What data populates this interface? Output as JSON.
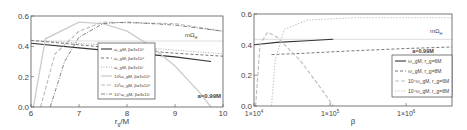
{
  "chart_data": [
    {
      "type": "line",
      "title": "",
      "xlabel": "r_g/M",
      "ylabel": "",
      "xlim": [
        6,
        10
      ],
      "ylim": [
        0.0,
        0.6
      ],
      "xticks": [
        "6",
        "7",
        "8",
        "9",
        "10"
      ],
      "yticks": [
        "0.0",
        "0.2",
        "0.4",
        "0.6"
      ],
      "grid": false,
      "legend_position": "center",
      "annotations": [
        "mΩ_H",
        "a=0.99M"
      ],
      "series": [
        {
          "name": "ω_gM, β=3x10^5",
          "style": "solid",
          "x": [
            6,
            7,
            8,
            9,
            9.75
          ],
          "y": [
            0.42,
            0.39,
            0.36,
            0.33,
            0.3
          ]
        },
        {
          "name": "ω_gM, β=3x10^6",
          "style": "dashed",
          "x": [
            6,
            7,
            8,
            9,
            10
          ],
          "y": [
            0.44,
            0.41,
            0.38,
            0.355,
            0.335
          ]
        },
        {
          "name": "ω_gM, β=3x10^7",
          "style": "dotted",
          "x": [
            6,
            7,
            8,
            9,
            10
          ],
          "y": [
            0.44,
            0.42,
            0.4,
            0.375,
            0.35
          ]
        },
        {
          "name": "10^2ω_gM, β=3x10^5",
          "style": "light-solid",
          "x": [
            6.05,
            6.3,
            7,
            7.5,
            8,
            8.5,
            9,
            9.5,
            9.75
          ],
          "y": [
            0.0,
            0.45,
            0.56,
            0.55,
            0.5,
            0.4,
            0.27,
            0.1,
            0.0
          ]
        },
        {
          "name": "10^3ω_gM, β=3x10^6",
          "style": "light-dashed",
          "x": [
            6.2,
            6.5,
            7,
            7.5,
            8,
            9,
            10
          ],
          "y": [
            0.0,
            0.35,
            0.5,
            0.56,
            0.555,
            0.55,
            0.5
          ]
        },
        {
          "name": "10^4ω_gM, β=3x10^7",
          "style": "dash-dot",
          "x": [
            6.4,
            6.7,
            7,
            7.5,
            8,
            9,
            10
          ],
          "y": [
            0.0,
            0.3,
            0.46,
            0.55,
            0.56,
            0.54,
            0.5
          ]
        }
      ],
      "reference_line": {
        "name": "mΩ_H",
        "y": 0.435
      }
    },
    {
      "type": "line",
      "title": "",
      "xlabel": "β",
      "ylabel": "",
      "xscale": "log",
      "xlim": [
        10000,
        4000000
      ],
      "ylim": [
        0.0,
        0.6
      ],
      "xticks": [
        "1×10^4",
        "1×10^5",
        "1×10^6"
      ],
      "yticks": [
        "0.0",
        "0.2",
        "0.4",
        "0.6"
      ],
      "grid": false,
      "legend_position": "lower right",
      "annotations": [
        "mΩ_H",
        "a=0.99M"
      ],
      "series": [
        {
          "name": "ω_gM, r_g=6M",
          "style": "solid",
          "x": [
            10000,
            20000,
            50000,
            110000
          ],
          "y": [
            0.4,
            0.415,
            0.425,
            0.435
          ]
        },
        {
          "name": "ω_gM, r_g=8M",
          "style": "dashed",
          "x": [
            17000,
            50000,
            200000,
            1000000,
            4000000
          ],
          "y": [
            0.335,
            0.345,
            0.36,
            0.375,
            0.385
          ]
        },
        {
          "name": "10^4ω_gM, r_g=6M",
          "style": "light-dashed",
          "x": [
            10500,
            12000,
            15000,
            20000,
            40000,
            80000,
            110000
          ],
          "y": [
            0.0,
            0.4,
            0.48,
            0.45,
            0.3,
            0.1,
            0.0
          ]
        },
        {
          "name": "10^4ω_gM, r_g=8M",
          "style": "light-dotted",
          "x": [
            17000,
            19000,
            25000,
            50000,
            200000,
            1000000,
            4000000
          ],
          "y": [
            0.0,
            0.3,
            0.5,
            0.56,
            0.575,
            0.575,
            0.575
          ]
        }
      ],
      "reference_line": {
        "name": "mΩ_H",
        "y": 0.435
      }
    }
  ],
  "left": {
    "xlabel_main": "r",
    "xlabel_sub": "g",
    "xlabel_rest": "/M",
    "annotation_omega": "mΩ",
    "annotation_omega_sub": "H",
    "annotation_spin": "a=0.99M",
    "legend": [
      "ω_gM, β=3x10⁵",
      "ω_gM, β=3x10⁶",
      "ω_gM, β=3x10⁷",
      "10²ω_gM, β=3x10⁵",
      "10³ω_gM, β=3x10⁶",
      "10⁴ω_gM, β=3x10⁷"
    ]
  },
  "right": {
    "xlabel": "β",
    "annotation_omega": "mΩ",
    "annotation_omega_sub": "H",
    "annotation_spin": "a=0.99M",
    "legend": [
      "ω_gM, r_g=6M",
      "ω_gM, r_g=8M",
      "10⁴ω_gM, r_g=6M",
      "10⁴ω_gM, r_g=8M"
    ]
  }
}
